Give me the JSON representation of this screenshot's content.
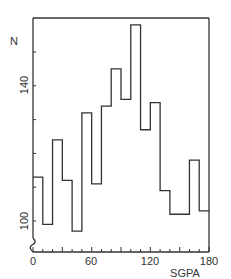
{
  "chart_data": {
    "type": "bar",
    "subtype": "step-histogram",
    "title": "",
    "xlabel": "SGPA",
    "ylabel": "N",
    "xlim": [
      0,
      180
    ],
    "ylim": [
      95,
      160
    ],
    "x_ticks": [
      0,
      60,
      120,
      180
    ],
    "x_minor_step": 10,
    "y_ticks": [
      100,
      140
    ],
    "y_minor_ticks": [
      100,
      110,
      120,
      130,
      140,
      150
    ],
    "grid": false,
    "legend": null,
    "axis_break": "y-axis below 100",
    "bin_width": 10,
    "categories": [
      "0-10",
      "10-20",
      "20-30",
      "30-40",
      "40-50",
      "50-60",
      "60-70",
      "70-80",
      "80-90",
      "90-100",
      "100-110",
      "110-120",
      "120-130",
      "130-140",
      "140-150",
      "150-160",
      "160-170",
      "170-180"
    ],
    "bin_edges": [
      0,
      10,
      20,
      30,
      40,
      50,
      60,
      70,
      80,
      90,
      100,
      110,
      120,
      130,
      140,
      150,
      160,
      170,
      180
    ],
    "values": [
      113,
      99,
      124,
      112,
      97,
      132,
      111,
      134,
      145,
      136,
      158,
      127,
      135,
      109,
      102,
      102,
      118,
      103
    ]
  },
  "labels": {
    "y_axis": "N",
    "x_axis": "SGPA",
    "x_tick_0": "0",
    "x_tick_60": "60",
    "x_tick_120": "120",
    "x_tick_180": "180",
    "y_tick_100": "100",
    "y_tick_140": "140"
  },
  "colors": {
    "line": "#333333",
    "background": "#ffffff"
  }
}
